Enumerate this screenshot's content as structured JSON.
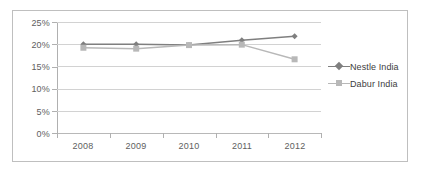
{
  "chart_data": {
    "type": "line",
    "title": "",
    "subtitle": "",
    "xlabel": "",
    "ylabel": "",
    "categories": [
      "2008",
      "2009",
      "2010",
      "2011",
      "2012"
    ],
    "series": [
      {
        "name": "Nestle India",
        "color": "#7f7f7f",
        "marker": "diamond",
        "values": [
          20.0,
          20.0,
          19.8,
          20.9,
          21.8
        ]
      },
      {
        "name": "Dabur India",
        "color": "#b8b8b8",
        "marker": "square",
        "values": [
          19.2,
          19.0,
          19.8,
          19.9,
          16.6
        ]
      }
    ],
    "ylim": [
      0,
      25
    ],
    "ytick_values": [
      0,
      5,
      10,
      15,
      20,
      25
    ],
    "ytick_labels": [
      "0%",
      "5%",
      "10%",
      "15%",
      "20%",
      "25%"
    ],
    "xtick_labels": [
      "2008",
      "2009",
      "2010",
      "2011",
      "2012"
    ],
    "grid": true,
    "grid_axis": "y",
    "legend": true,
    "legend_position": "right",
    "legend_entries": [
      "Nestle India",
      "Dabur India"
    ],
    "annotations": []
  },
  "colors": {
    "nestle": "#7f7f7f",
    "dabur": "#b8b8b8",
    "gridline": "#d2d2d2",
    "axis": "#b0b0b0",
    "frame": "#bfbfbf",
    "text": "#5e5e5e",
    "background": "#ffffff"
  }
}
